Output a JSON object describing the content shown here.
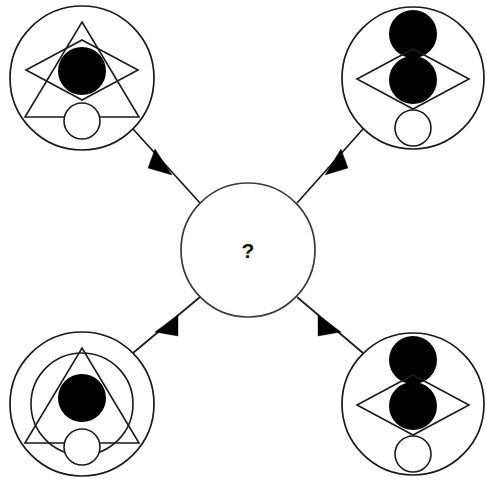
{
  "figure": {
    "background_color": "#ffffff",
    "stroke_color": "#1a1a1a",
    "fill_color": "#000000",
    "width": 487,
    "height": 482
  },
  "center": {
    "label": "?",
    "name": "unknown-shape",
    "cx": 248,
    "cy": 250,
    "r": 67
  },
  "nodes": [
    {
      "id": "top-left",
      "position": "top-left",
      "cx": 82,
      "cy": 78,
      "r": 72,
      "elements": [
        "outer-circle",
        "triangle-up",
        "diamond",
        "filled-circle-center",
        "open-circle-bottom"
      ],
      "description": "Circle containing an upward triangle overlapped by a diamond, a large filled black circle at the centre and a small open circle near the bottom"
    },
    {
      "id": "top-right",
      "position": "top-right",
      "cx": 413,
      "cy": 78,
      "r": 71,
      "elements": [
        "outer-circle",
        "filled-circle-top",
        "diamond",
        "filled-circle-center",
        "open-circle-bottom"
      ],
      "description": "Circle containing a filled black circle at the top, a diamond with a filled black circle inside it and a small open circle near the bottom"
    },
    {
      "id": "bottom-left",
      "position": "bottom-left",
      "cx": 82,
      "cy": 404,
      "r": 72,
      "elements": [
        "outer-circle",
        "inner-circle",
        "triangle-up",
        "filled-circle-center",
        "open-circle-bottom"
      ],
      "description": "Circle containing a second inner circle, an upward triangle, a large filled black circle at the centre and a small open circle near the bottom"
    },
    {
      "id": "bottom-right",
      "position": "bottom-right",
      "cx": 413,
      "cy": 404,
      "r": 71,
      "elements": [
        "outer-circle",
        "filled-circle-top",
        "diamond",
        "filled-circle-center",
        "open-circle-bottom"
      ],
      "description": "Circle containing a filled black circle at the top, a diamond with a filled black circle inside it and a small open circle near the bottom"
    }
  ],
  "arrows": [
    {
      "id": "arrow-top-left",
      "from": "top-left",
      "to": "center",
      "direction": "down-right"
    },
    {
      "id": "arrow-top-right",
      "from": "top-right",
      "to": "center",
      "direction": "down-left"
    },
    {
      "id": "arrow-bottom-left",
      "from": "bottom-left",
      "to": "center",
      "direction": "up-right"
    },
    {
      "id": "arrow-bottom-right",
      "from": "bottom-right",
      "to": "center",
      "direction": "up-left"
    }
  ]
}
